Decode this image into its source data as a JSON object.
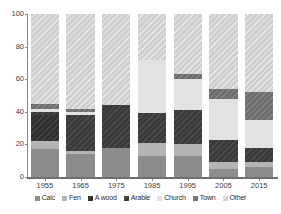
{
  "chart_data": {
    "type": "bar",
    "stacked": true,
    "title": "",
    "subtitle": "",
    "xlabel": "",
    "ylabel": "",
    "ylim": [
      0,
      100
    ],
    "yticks": [
      0,
      20,
      40,
      60,
      80,
      100
    ],
    "grid": false,
    "legend_position": "bottom",
    "categories": [
      "1955",
      "1965",
      "1975",
      "1985",
      "1995",
      "2005",
      "2015"
    ],
    "series": [
      {
        "name": "Calc",
        "color": "#8c8c8c",
        "values": [
          17,
          14,
          18,
          13,
          13,
          5,
          6
        ]
      },
      {
        "name": "Fen",
        "color": "#b4b4b4",
        "values": [
          5,
          2,
          0,
          8,
          7,
          4,
          3
        ]
      },
      {
        "name": "A wood",
        "color": "#2f2f2f",
        "values": [
          16,
          0,
          0,
          0,
          0,
          0,
          0
        ]
      },
      {
        "name": "Arable",
        "color": "#3a3a3a",
        "values": [
          2,
          22,
          26,
          18,
          21,
          14,
          9
        ]
      },
      {
        "name": "Church",
        "color": "#e2e2e2",
        "values": [
          2,
          2,
          0,
          33,
          19,
          25,
          17
        ]
      },
      {
        "name": "Town",
        "color": "#6e6e6e",
        "values": [
          3,
          2,
          0,
          0,
          3,
          6,
          17
        ]
      },
      {
        "name": "Other",
        "color": "#cfcfcf",
        "values": [
          55,
          58,
          56,
          28,
          37,
          46,
          48
        ]
      }
    ]
  },
  "legend": {
    "items": [
      {
        "label": "Calc",
        "swatch": "legend-swatch-calc"
      },
      {
        "label": "Fen",
        "swatch": "legend-swatch-fen"
      },
      {
        "label": "A wood",
        "swatch": "legend-swatch-awood"
      },
      {
        "label": "Arable",
        "swatch": "legend-swatch-arable"
      },
      {
        "label": "Church",
        "swatch": "legend-swatch-church"
      },
      {
        "label": "Town",
        "swatch": "legend-swatch-town"
      },
      {
        "label": "Other",
        "swatch": "legend-swatch-other"
      }
    ]
  }
}
